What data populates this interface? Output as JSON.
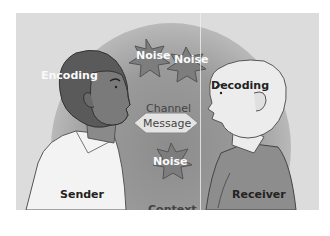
{
  "diagram": {
    "labels": {
      "encoding": "Encoding",
      "decoding": "Decoding",
      "channel": "Channel",
      "message": "Message",
      "sender": "Sender",
      "receiver": "Receiver",
      "context": "Context",
      "noise": [
        "Noise",
        "Noise",
        "Noise"
      ]
    },
    "nodes": [
      {
        "id": "sender",
        "label": "Sender",
        "role": "person-left"
      },
      {
        "id": "receiver",
        "label": "Receiver",
        "role": "person-right"
      },
      {
        "id": "message",
        "label": "Message",
        "shape": "hexagon"
      },
      {
        "id": "noise1",
        "label": "Noise",
        "shape": "star"
      },
      {
        "id": "noise2",
        "label": "Noise",
        "shape": "star"
      },
      {
        "id": "noise3",
        "label": "Noise",
        "shape": "star"
      }
    ],
    "colors": {
      "background": "#dcdcdc",
      "sender_head": "#5a5a5a",
      "receiver_head": "#e6e6e6",
      "noise_star": "#7d7d7d"
    }
  }
}
